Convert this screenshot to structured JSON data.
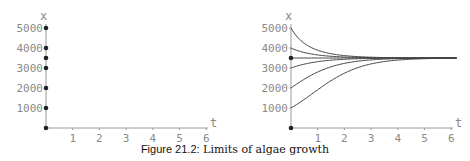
{
  "caption": {
    "label": "Figure 21.2:",
    "text": " Limits of algae growth"
  },
  "chart_data": [
    {
      "type": "scatter",
      "title": "",
      "xlabel": "t",
      "ylabel": "x",
      "xlim": [
        0,
        6
      ],
      "ylim": [
        0,
        5000
      ],
      "x_ticks": [
        1,
        2,
        3,
        4,
        5,
        6
      ],
      "y_ticks": [
        1000,
        2000,
        3000,
        4000,
        5000
      ],
      "grid": false,
      "points": [
        {
          "t": 0,
          "x": 5000
        },
        {
          "t": 0,
          "x": 4000
        },
        {
          "t": 0,
          "x": 3500
        },
        {
          "t": 0,
          "x": 3000
        },
        {
          "t": 0,
          "x": 2000
        },
        {
          "t": 0,
          "x": 1000
        },
        {
          "t": 0,
          "x": 0
        }
      ]
    },
    {
      "type": "line",
      "title": "",
      "xlabel": "t",
      "ylabel": "x",
      "xlim": [
        0,
        6
      ],
      "ylim": [
        0,
        5000
      ],
      "x_ticks": [
        1,
        2,
        3,
        4,
        5,
        6
      ],
      "y_ticks": [
        1000,
        2000,
        3000,
        4000,
        5000
      ],
      "grid": false,
      "model": "logistic",
      "carrying_capacity": 3500,
      "growth_rate": 1.1,
      "series": [
        {
          "name": "x0=5000",
          "x0": 5000
        },
        {
          "name": "x0=4000",
          "x0": 4000
        },
        {
          "name": "x0=3500",
          "x0": 3500
        },
        {
          "name": "x0=3000",
          "x0": 3000
        },
        {
          "name": "x0=2000",
          "x0": 2000
        },
        {
          "name": "x0=1000",
          "x0": 1000
        }
      ],
      "equilibrium_points": [
        {
          "t": 0,
          "x": 3500
        },
        {
          "t": 0,
          "x": 0
        }
      ]
    }
  ]
}
